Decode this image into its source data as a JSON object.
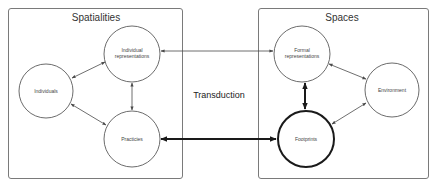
{
  "diagram": {
    "center_label": "Transduction",
    "groups": [
      {
        "id": "spatialities",
        "title": "Spatialities",
        "nodes": [
          {
            "id": "individual-representations",
            "lines": [
              "Individual",
              "representations"
            ]
          },
          {
            "id": "individuals",
            "lines": [
              "Individuals"
            ]
          },
          {
            "id": "practicies",
            "lines": [
              "Practicies"
            ]
          }
        ]
      },
      {
        "id": "spaces",
        "title": "Spaces",
        "nodes": [
          {
            "id": "formal-representations",
            "lines": [
              "Formal",
              "representations"
            ]
          },
          {
            "id": "environment",
            "lines": [
              "Environment"
            ]
          },
          {
            "id": "footprints",
            "lines": [
              "Footprints"
            ],
            "emphasis": "bold"
          }
        ]
      }
    ],
    "edges": [
      {
        "from": "individuals",
        "to": "individual-representations",
        "style": "thin",
        "direction": "both"
      },
      {
        "from": "individuals",
        "to": "practicies",
        "style": "thin",
        "direction": "both"
      },
      {
        "from": "practicies",
        "to": "individual-representations",
        "style": "thin",
        "direction": "both"
      },
      {
        "from": "individual-representations",
        "to": "formal-representations",
        "style": "thin",
        "direction": "both"
      },
      {
        "from": "practicies",
        "to": "footprints",
        "style": "bold",
        "direction": "both"
      },
      {
        "from": "formal-representations",
        "to": "footprints",
        "style": "bold",
        "direction": "both"
      },
      {
        "from": "formal-representations",
        "to": "environment",
        "style": "thin",
        "direction": "both"
      },
      {
        "from": "environment",
        "to": "footprints",
        "style": "thin",
        "direction": "both"
      }
    ],
    "colors": {
      "box_stroke": "#7a7a7a",
      "node_stroke": "#5a5a5a",
      "bold_stroke": "#1a1a1a",
      "text": "#333333"
    }
  }
}
